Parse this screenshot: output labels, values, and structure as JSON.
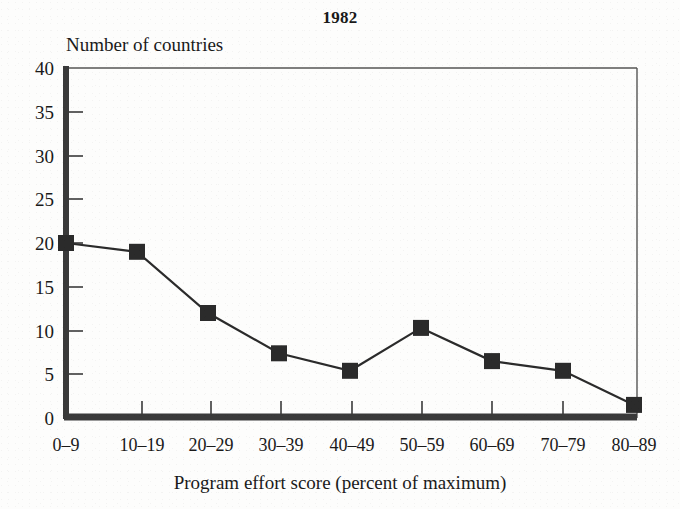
{
  "chart_data": {
    "type": "line",
    "title": "1982",
    "xlabel": "Program effort score (percent of maximum)",
    "ylabel": "Number of countries",
    "categories": [
      "0–9",
      "10–19",
      "20–29",
      "30–39",
      "40–49",
      "50–59",
      "60–69",
      "70–79",
      "80–89"
    ],
    "values": [
      20,
      19,
      12,
      7.4,
      5.4,
      10.3,
      6.5,
      5.4,
      1.5
    ],
    "ylim": [
      0,
      40
    ],
    "yticks": [
      0,
      5,
      10,
      15,
      20,
      25,
      30,
      35,
      40
    ],
    "ytick_labels": [
      "0",
      "5",
      "10",
      "15",
      "20",
      "25",
      "30",
      "35",
      "40"
    ],
    "grid": false,
    "legend": false,
    "marker": "square",
    "series_color": "#2b2b2b",
    "line_color": "#2b2b2b",
    "axis_color": "#333333"
  }
}
